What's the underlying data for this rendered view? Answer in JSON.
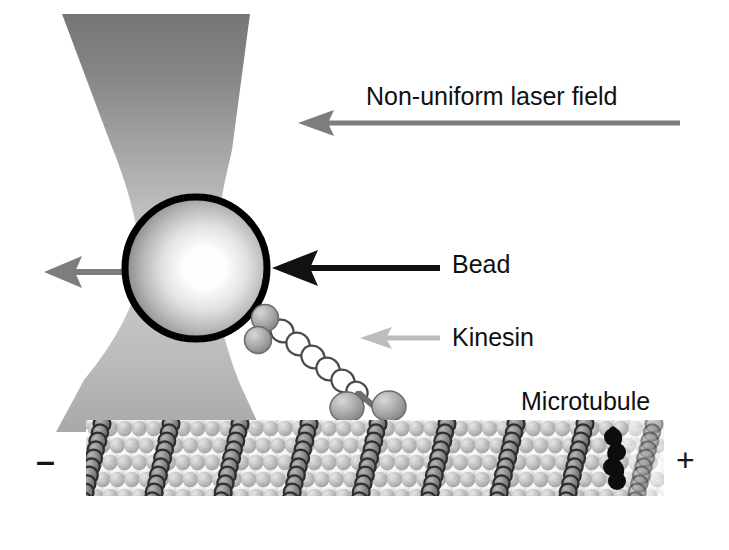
{
  "figure": {
    "type": "diagram",
    "width": 729,
    "height": 550,
    "background": "#ffffff"
  },
  "labels": {
    "laser_field": "Non-uniform laser field",
    "bead": "Bead",
    "kinesin": "Kinesin",
    "microtubule": "Microtubule",
    "minus_end": "–",
    "plus_end": "+"
  },
  "colors": {
    "laser_dark": "#7c7c7c",
    "laser_light": "#c9c9c9",
    "bead_rim": "#000000",
    "bead_highlight": "#ffffff",
    "bead_shade": "#8f8f8f",
    "arrow_black": "#121212",
    "arrow_gray": "#7d7d7d",
    "arrow_light_gray": "#bdbdbd",
    "kinesin_gray": "#9c9c9c",
    "kinesin_outline": "#4a4a4a",
    "tubulin_light": "#f2f2f2",
    "tubulin_mid": "#b4b4b4",
    "tubulin_dark": "#3a3a3a",
    "protofilament_black": "#0d0d0d",
    "text": "#101010"
  },
  "elements": {
    "laser_cone": {
      "name": "non-uniform-laser-field-beam",
      "shape": "hourglass",
      "top_left_x": 62,
      "top_right_x": 250,
      "waist_y": 268,
      "waist_left_x": 142,
      "waist_right_x": 212,
      "bottom_left_x": 56,
      "bottom_right_x": 262,
      "bottom_y": 432
    },
    "bead": {
      "name": "trapped-bead",
      "cx": 196,
      "cy": 268,
      "r": 74,
      "outline_width": 7
    },
    "force_arrow": {
      "name": "trap-force-arrow",
      "from_x": 190,
      "to_x": 44,
      "y": 272,
      "color": "#7d7d7d",
      "direction": "left"
    },
    "bead_pointer_arrow": {
      "name": "bead-label-arrow",
      "from_x": 440,
      "to_x": 272,
      "y": 268,
      "color": "#121212",
      "direction": "left"
    },
    "kinesin_pointer_arrow": {
      "name": "kinesin-label-arrow",
      "from_x": 440,
      "to_x": 360,
      "y": 338,
      "color": "#bdbdbd",
      "direction": "left"
    },
    "laser_pointer_arrow": {
      "name": "laser-field-label-arrow",
      "from_x": 680,
      "to_x": 298,
      "y": 123,
      "color": "#7d7d7d",
      "direction": "left"
    },
    "kinesin": {
      "name": "kinesin-motor-protein",
      "cargo_domains": 2,
      "stalk_beads": 7,
      "motor_heads": 2,
      "attachment_x": 258,
      "attachment_y": 322,
      "head_y": 408
    },
    "microtubule": {
      "name": "microtubule-lattice",
      "left_x": 88,
      "right_x": 660,
      "top_y": 424,
      "bottom_y": 492,
      "rows": 5,
      "columns": 38,
      "protofilament_stripes": 9
    }
  }
}
